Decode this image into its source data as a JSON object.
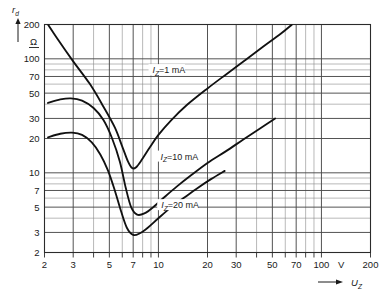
{
  "chart_data": {
    "type": "line",
    "title": "",
    "subtitle": "",
    "xlabel": "U_Z",
    "xlabel_display": "U",
    "xlabel_sub": "Z",
    "ylabel": "r_d",
    "ylabel_display": "r",
    "ylabel_sub": "d",
    "x_unit": "V",
    "y_unit": "Ω",
    "xscale": "log",
    "yscale": "log",
    "xlim": [
      2,
      200
    ],
    "ylim": [
      2,
      200
    ],
    "grid": true,
    "legend_position": "inline-annotations",
    "xticks": [
      2,
      3,
      5,
      7,
      10,
      20,
      30,
      50,
      70,
      100,
      200
    ],
    "xtick_labels": [
      "2",
      "3",
      "5",
      "7",
      "10",
      "20",
      "30",
      "50",
      "70",
      "100",
      "200"
    ],
    "yticks": [
      2,
      3,
      5,
      7,
      10,
      20,
      30,
      50,
      70,
      100,
      200
    ],
    "ytick_labels": [
      "2",
      "3",
      "5",
      "7",
      "10",
      "20",
      "30",
      "50",
      "70",
      "100",
      "200"
    ],
    "x_minor_gridlines": [
      2,
      3,
      4,
      5,
      6,
      7,
      8,
      9,
      10,
      20,
      30,
      40,
      50,
      60,
      70,
      80,
      90,
      100,
      200
    ],
    "y_minor_gridlines": [
      2,
      3,
      4,
      5,
      6,
      7,
      8,
      9,
      10,
      20,
      30,
      40,
      50,
      60,
      70,
      80,
      90,
      100,
      200
    ],
    "series": [
      {
        "name": "I_Z = 1 mA",
        "label_display": "I",
        "label_sub": "Z",
        "label_rest": "=1 mA",
        "annotation_x": 9.2,
        "annotation_y": 78,
        "points": [
          [
            2.1,
            200
          ],
          [
            2.4,
            150
          ],
          [
            3.0,
            95
          ],
          [
            3.8,
            60
          ],
          [
            4.6,
            38
          ],
          [
            5.4,
            25
          ],
          [
            6.0,
            17
          ],
          [
            6.5,
            12.6
          ],
          [
            6.9,
            11.0
          ],
          [
            7.3,
            11.2
          ],
          [
            7.9,
            13.0
          ],
          [
            8.8,
            16.5
          ],
          [
            10.0,
            21.5
          ],
          [
            12.0,
            29.0
          ],
          [
            15.0,
            39.5
          ],
          [
            20.0,
            55
          ],
          [
            26.0,
            73
          ],
          [
            34.0,
            97
          ],
          [
            44.0,
            128
          ],
          [
            56.0,
            165
          ],
          [
            66.0,
            200
          ]
        ]
      },
      {
        "name": "I_Z = 10 mA",
        "label_display": "I",
        "label_sub": "Z",
        "label_rest": "=10 mA",
        "annotation_x": 10.3,
        "annotation_y": 13.6,
        "points": [
          [
            2.1,
            41
          ],
          [
            2.5,
            44
          ],
          [
            2.9,
            45
          ],
          [
            3.4,
            43
          ],
          [
            4.0,
            37
          ],
          [
            4.6,
            29
          ],
          [
            5.2,
            20
          ],
          [
            5.8,
            12.5
          ],
          [
            6.3,
            7.4
          ],
          [
            6.8,
            5.0
          ],
          [
            7.4,
            4.3
          ],
          [
            8.2,
            4.4
          ],
          [
            9.3,
            5.0
          ],
          [
            11.0,
            6.2
          ],
          [
            13.0,
            7.6
          ],
          [
            16.0,
            9.6
          ],
          [
            20.0,
            12.2
          ],
          [
            26.0,
            15.5
          ],
          [
            33.0,
            19.5
          ],
          [
            42.0,
            24.5
          ],
          [
            52.0,
            30.0
          ]
        ]
      },
      {
        "name": "I_Z = 20 mA",
        "label_display": "I",
        "label_sub": "Z",
        "label_rest": "=20 mA",
        "annotation_x": 10.4,
        "annotation_y": 5.1,
        "points": [
          [
            2.1,
            20.5
          ],
          [
            2.5,
            22.0
          ],
          [
            2.95,
            22.5
          ],
          [
            3.4,
            21.5
          ],
          [
            3.9,
            18.5
          ],
          [
            4.4,
            14.5
          ],
          [
            4.9,
            10.5
          ],
          [
            5.4,
            7.0
          ],
          [
            5.9,
            4.6
          ],
          [
            6.4,
            3.3
          ],
          [
            7.0,
            2.85
          ],
          [
            7.7,
            2.95
          ],
          [
            8.6,
            3.3
          ],
          [
            10.0,
            4.0
          ],
          [
            12.0,
            5.0
          ],
          [
            14.5,
            6.1
          ],
          [
            17.5,
            7.4
          ],
          [
            21.0,
            8.8
          ],
          [
            25.5,
            10.4
          ]
        ]
      }
    ]
  },
  "axes": {
    "y_axis_name": "r",
    "y_axis_sub": "d",
    "y_unit": "Ω",
    "x_axis_name": "U",
    "x_axis_sub": "Z",
    "x_unit": "V",
    "y_arrow_icon": "up-arrow-icon",
    "x_arrow_icon": "right-arrow-icon"
  },
  "colors": {
    "curve": "#111111",
    "grid_major": "#4a4a4a",
    "grid_minor": "#8a8a8a",
    "frame": "#2b2b2b",
    "background": "#ffffff",
    "text": "#1a1a1a"
  }
}
